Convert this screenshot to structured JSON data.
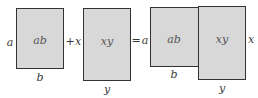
{
  "diagram": {
    "colors": {
      "fill": "#d8d8d8",
      "border": "#333333",
      "text": "#3a3a3a"
    },
    "left_term": {
      "area_label": "ab",
      "side_label": "a",
      "bottom_label": "b"
    },
    "plus_op": "+",
    "second_term": {
      "side_label": "x",
      "area_label": "xy",
      "bottom_label": "y"
    },
    "equals_op": "=",
    "result": {
      "left_side_label": "a",
      "left_area_label": "ab",
      "left_bottom_label": "b",
      "right_area_label": "xy",
      "right_side_label": "x",
      "right_bottom_label": "y"
    }
  }
}
